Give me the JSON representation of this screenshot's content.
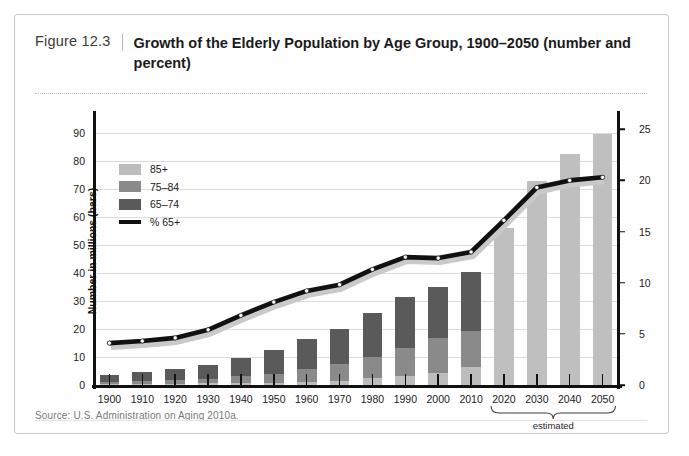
{
  "figure": {
    "number": "Figure 12.3",
    "title": "Growth of the Elderly Population by Age Group, 1900–2050 (number and percent)",
    "source": "Source: U.S. Administration on Aging 2010a."
  },
  "colors": {
    "age_85_plus": "#bdbdbd",
    "age_75_84": "#8a8a8a",
    "age_65_74": "#5a5a5a",
    "percent_line": "#111111",
    "projected_bar": "#bfbfbf",
    "gridline": "#dcdcdc",
    "axis": "#111111"
  },
  "legend": {
    "position": "upper-left-inside",
    "items": [
      {
        "label": "85+",
        "kind": "swatch",
        "color": "#bdbdbd"
      },
      {
        "label": "75–84",
        "kind": "swatch",
        "color": "#8a8a8a"
      },
      {
        "label": "65–74",
        "kind": "swatch",
        "color": "#5a5a5a"
      },
      {
        "label": "% 65+",
        "kind": "line",
        "color": "#111111"
      }
    ]
  },
  "annotations": {
    "estimated_label": "estimated",
    "estimated_range": [
      "2020",
      "2050"
    ]
  },
  "chart_data": {
    "type": "bar",
    "title": "Growth of the Elderly Population by Age Group, 1900–2050 (number and percent)",
    "xlabel": "",
    "ylabel": "Number in millions (bars)",
    "y2label": "Percentage 65 and older",
    "ylim": [
      0,
      95
    ],
    "y2lim": [
      0,
      26
    ],
    "yticks": [
      0,
      10,
      20,
      30,
      40,
      50,
      60,
      70,
      80,
      90
    ],
    "y2ticks": [
      0,
      5,
      10,
      15,
      20,
      25
    ],
    "grid": true,
    "stacked": true,
    "categories": [
      "1900",
      "1910",
      "1920",
      "1930",
      "1940",
      "1950",
      "1960",
      "1970",
      "1980",
      "1990",
      "2000",
      "2010",
      "2020",
      "2030",
      "2040",
      "2050"
    ],
    "series": [
      {
        "name": "65–74",
        "color": "#5a5a5a",
        "values": [
          2.2,
          3.0,
          3.8,
          5.0,
          6.4,
          8.4,
          11.0,
          12.5,
          15.6,
          18.1,
          18.4,
          21.0,
          null,
          null,
          null,
          null
        ]
      },
      {
        "name": "75–84",
        "color": "#8a8a8a",
        "values": [
          0.8,
          1.0,
          1.3,
          1.6,
          2.3,
          3.3,
          4.6,
          6.1,
          7.7,
          10.1,
          12.4,
          13.0,
          null,
          null,
          null,
          null
        ]
      },
      {
        "name": "85+",
        "color": "#bdbdbd",
        "values": [
          0.4,
          0.5,
          0.5,
          0.6,
          0.8,
          0.8,
          1.0,
          1.4,
          2.4,
          3.1,
          4.3,
          6.3,
          null,
          null,
          null,
          null
        ]
      },
      {
        "name": "Projected total 65+",
        "color": "#bfbfbf",
        "values": [
          null,
          null,
          null,
          null,
          null,
          null,
          null,
          null,
          null,
          null,
          null,
          null,
          56.0,
          72.8,
          82.5,
          89.5
        ]
      }
    ],
    "totals": [
      3.1,
      4.0,
      4.9,
      6.6,
      9.0,
      12.3,
      16.6,
      20.1,
      25.7,
      31.2,
      35.0,
      40.2,
      56.0,
      72.8,
      82.5,
      89.5
    ],
    "line_series": {
      "name": "% 65+",
      "color": "#111111",
      "axis": "right",
      "marker": "white-filled-circle",
      "values": [
        4.1,
        4.3,
        4.6,
        5.4,
        6.8,
        8.1,
        9.2,
        9.8,
        11.3,
        12.5,
        12.4,
        13.0,
        16.1,
        19.3,
        20.0,
        20.3
      ]
    }
  }
}
